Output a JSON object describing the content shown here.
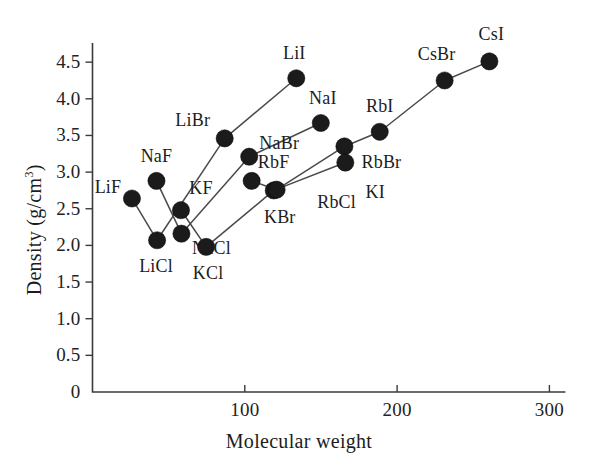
{
  "chart_data": {
    "type": "scatter",
    "title": "",
    "xlabel": "Molecular weight",
    "ylabel": "Density (g/cm",
    "ylabel_sup": "3",
    "ylabel_tail": ")",
    "xlim": [
      0,
      310
    ],
    "ylim": [
      0,
      4.75
    ],
    "grid": false,
    "legend": "none",
    "marker_color": "#1b1b1b",
    "line_color": "#4a4a4a",
    "axis_color": "#3b3b3b",
    "xticks": [
      {
        "value": 100,
        "label": "100"
      },
      {
        "value": 200,
        "label": "200"
      },
      {
        "value": 300,
        "label": "300"
      }
    ],
    "yticks": [
      {
        "value": 0,
        "label": "0"
      },
      {
        "value": 0.5,
        "label": "0.5"
      },
      {
        "value": 1.0,
        "label": "1.0"
      },
      {
        "value": 1.5,
        "label": "1.5"
      },
      {
        "value": 2.0,
        "label": "2.0"
      },
      {
        "value": 2.5,
        "label": "2.5"
      },
      {
        "value": 3.0,
        "label": "3.0"
      },
      {
        "value": 3.5,
        "label": "3.5"
      },
      {
        "value": 4.0,
        "label": "4.0"
      },
      {
        "value": 4.5,
        "label": "4.5"
      }
    ],
    "points": [
      {
        "name": "LiF",
        "x": 25.9,
        "y": 2.64,
        "label_dx": -24,
        "label_dy": -11
      },
      {
        "name": "NaF",
        "x": 42.0,
        "y": 2.88,
        "label_dx": 0,
        "label_dy": -25
      },
      {
        "name": "LiCl",
        "x": 42.4,
        "y": 2.07,
        "label_dx": -1,
        "label_dy": 26
      },
      {
        "name": "KF",
        "x": 58.1,
        "y": 2.48,
        "label_dx": 20,
        "label_dy": -22
      },
      {
        "name": "NaCl",
        "x": 58.4,
        "y": 2.16,
        "label_dx": 30,
        "label_dy": 14
      },
      {
        "name": "KCl",
        "x": 74.6,
        "y": 1.98,
        "label_dx": 2,
        "label_dy": 26
      },
      {
        "name": "LiBr",
        "x": 86.8,
        "y": 3.46,
        "label_dx": -32,
        "label_dy": -18
      },
      {
        "name": "RbF",
        "x": 104.5,
        "y": 2.88,
        "label_dx": 22,
        "label_dy": -19
      },
      {
        "name": "NaBr",
        "x": 102.9,
        "y": 3.21,
        "label_dx": 30,
        "label_dy": -14
      },
      {
        "name": "KBr",
        "x": 119.0,
        "y": 2.75,
        "label_dx": 6,
        "label_dy": 27
      },
      {
        "name": "LiI",
        "x": 133.8,
        "y": 4.28,
        "label_dx": -2,
        "label_dy": -25
      },
      {
        "name": "RbCl",
        "x": 120.9,
        "y": 2.76,
        "label_dx": 60,
        "label_dy": 12
      },
      {
        "name": "NaI",
        "x": 149.9,
        "y": 3.67,
        "label_dx": 2,
        "label_dy": -25
      },
      {
        "name": "RbBr",
        "x": 165.4,
        "y": 3.35,
        "label_dx": 37,
        "label_dy": 16
      },
      {
        "name": "KI",
        "x": 166.0,
        "y": 3.13,
        "label_dx": 30,
        "label_dy": 29
      },
      {
        "name": "RbI",
        "x": 188.6,
        "y": 3.55,
        "label_dx": 0,
        "label_dy": -26
      },
      {
        "name": "CsBr",
        "x": 231.2,
        "y": 4.25,
        "label_dx": -8,
        "label_dy": -26
      },
      {
        "name": "CsI",
        "x": 260.6,
        "y": 4.51,
        "label_dx": 2,
        "label_dy": -27
      }
    ],
    "series": [
      {
        "name": "lithium-halides",
        "point_names": [
          "LiF",
          "LiCl",
          "LiBr",
          "LiI"
        ]
      },
      {
        "name": "sodium-halides",
        "point_names": [
          "NaF",
          "NaCl",
          "NaBr",
          "NaI"
        ]
      },
      {
        "name": "potassium-halides",
        "point_names": [
          "KF",
          "KCl",
          "KBr",
          "KI"
        ]
      },
      {
        "name": "rubidium-halides",
        "point_names": [
          "RbF",
          "RbCl",
          "RbBr",
          "RbI"
        ]
      },
      {
        "name": "cesium-halides",
        "point_names": [
          "CsBr",
          "CsI"
        ]
      }
    ],
    "extra_segments": [
      {
        "name": "ki-csbr-link",
        "point_names": [
          "RbI",
          "CsBr"
        ]
      }
    ]
  }
}
